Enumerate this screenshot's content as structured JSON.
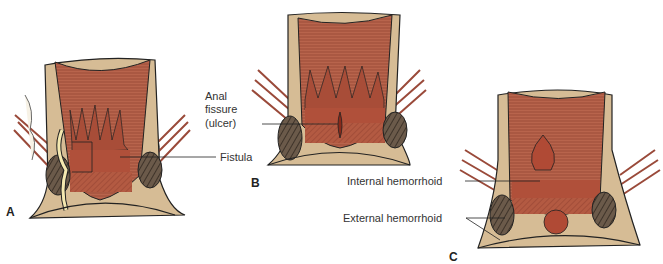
{
  "figure": {
    "panels": [
      {
        "id": "A",
        "label": "A",
        "annotations": [
          "Fistula"
        ]
      },
      {
        "id": "B",
        "label": "B",
        "annotations": [
          "Anal fissure (ulcer)"
        ]
      },
      {
        "id": "C",
        "label": "C",
        "annotations": [
          "Internal hemorrhoid",
          "External hemorrhoid"
        ]
      }
    ],
    "labels": {
      "fistula": "Fistula",
      "anal_fissure_line1": "Anal",
      "anal_fissure_line2": "fissure",
      "anal_fissure_line3": "(ulcer)",
      "internal_hemorrhoid": "Internal hemorrhoid",
      "external_hemorrhoid": "External hemorrhoid"
    },
    "colors": {
      "mucosa": "#b5614a",
      "mucosa_dark": "#9a4232",
      "wall": "#d8c09a",
      "outline": "#222222",
      "fat": "#f3ecd9"
    }
  }
}
